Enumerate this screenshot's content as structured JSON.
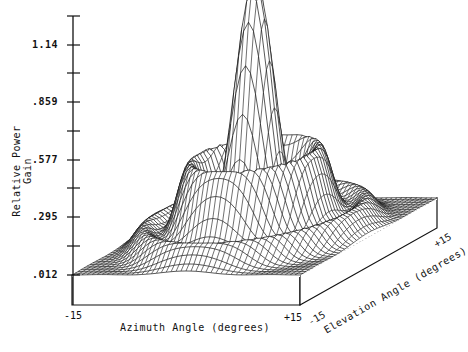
{
  "chart_data": {
    "type": "surface3d",
    "title": "",
    "xlabel": "Azimuth Angle (degrees)",
    "ylabel": "Relative Power Gain",
    "zlabel": "Elevation Angle (degrees)",
    "x_range": [
      -15,
      15
    ],
    "elevation_range": [
      -15,
      15
    ],
    "x_tick_labels": [
      "-15",
      "+15"
    ],
    "elevation_tick_labels": [
      "-15",
      "+15"
    ],
    "y_ticks": [
      0.012,
      0.295,
      0.577,
      0.859,
      1.14
    ],
    "y_tick_labels": [
      ".012",
      ".295",
      ".577",
      ".859",
      "1.14"
    ],
    "ylim": [
      0.012,
      1.28
    ],
    "peak_value": 1.26,
    "peak_location": [
      0,
      0
    ],
    "first_sidelobe_level": 0.42,
    "grid": false,
    "legend": null
  },
  "axes": {
    "y_label": "Relative Power Gain",
    "x_label": "Azimuth Angle (degrees)",
    "elev_label": "Elevation Angle (degrees)",
    "x_min": "-15",
    "x_max": "+15",
    "e_min": "-15",
    "e_max": "+15",
    "y_ticks": [
      "1.14",
      ".859",
      ".577",
      ".295",
      ".012"
    ]
  },
  "colors": {
    "ink": "#111111",
    "paper": "#ffffff"
  }
}
